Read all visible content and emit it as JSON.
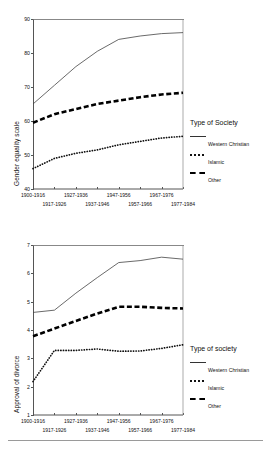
{
  "figure": {
    "divider_present": true
  },
  "charts": [
    {
      "ylabel": "Gender equality scale",
      "legend_title": "Type of Society",
      "legend": [
        {
          "label": "Western Christian",
          "style": "solid"
        },
        {
          "label": "Islamic",
          "style": "dotted"
        },
        {
          "label": "Other",
          "style": "dashed"
        }
      ],
      "yticks": [
        "40",
        "50",
        "60",
        "70",
        "80",
        "90"
      ],
      "xticks": [
        "1900-1916",
        "1917-1926",
        "1927-1936",
        "1937-1946",
        "1947-1956",
        "1957-1966",
        "1967-1976",
        "1977-1984"
      ]
    },
    {
      "ylabel": "Approval of divorce",
      "legend_title": "Type of society",
      "legend": [
        {
          "label": "Western Christian",
          "style": "solid"
        },
        {
          "label": "Islamic",
          "style": "dotted"
        },
        {
          "label": "Other",
          "style": "dashed"
        }
      ],
      "yticks": [
        "1",
        "2",
        "3",
        "4",
        "5",
        "6",
        "7"
      ],
      "xticks": [
        "1900-1916",
        "1917-1926",
        "1927-1936",
        "1937-1946",
        "1947-1956",
        "1957-1966",
        "1967-1976",
        "1977-1984"
      ]
    }
  ],
  "chart_data": [
    {
      "type": "line",
      "title": "",
      "xlabel": "",
      "ylabel": "Gender equality scale",
      "ylim": [
        40,
        90
      ],
      "grid": false,
      "legend_position": "right",
      "legend_title": "Type of Society",
      "categories": [
        "1900-1916",
        "1917-1926",
        "1927-1936",
        "1937-1946",
        "1947-1956",
        "1957-1966",
        "1967-1976",
        "1977-1984"
      ],
      "series": [
        {
          "name": "Western Christian",
          "style": "solid",
          "values": [
            65.0,
            70.5,
            76.0,
            80.5,
            84.0,
            85.0,
            85.7,
            86.0
          ]
        },
        {
          "name": "Islamic",
          "style": "dotted",
          "values": [
            46.0,
            49.0,
            50.5,
            51.5,
            53.0,
            54.0,
            55.0,
            55.5
          ]
        },
        {
          "name": "Other",
          "style": "dashed",
          "values": [
            59.5,
            62.0,
            63.5,
            65.0,
            66.0,
            67.0,
            67.8,
            68.3
          ]
        }
      ]
    },
    {
      "type": "line",
      "title": "",
      "xlabel": "",
      "ylabel": "Approval of divorce",
      "ylim": [
        1,
        7
      ],
      "grid": false,
      "legend_position": "right",
      "legend_title": "Type of society",
      "categories": [
        "1900-1916",
        "1917-1926",
        "1927-1936",
        "1937-1946",
        "1947-1956",
        "1957-1966",
        "1967-1976",
        "1977-1984"
      ],
      "series": [
        {
          "name": "Western Christian",
          "style": "solid",
          "values": [
            4.62,
            4.7,
            5.3,
            5.85,
            6.38,
            6.45,
            6.57,
            6.5
          ]
        },
        {
          "name": "Islamic",
          "style": "dotted",
          "values": [
            2.18,
            3.28,
            3.28,
            3.33,
            3.25,
            3.26,
            3.35,
            3.48
          ]
        },
        {
          "name": "Other",
          "style": "dashed",
          "values": [
            3.78,
            4.05,
            4.32,
            4.58,
            4.82,
            4.82,
            4.78,
            4.76
          ]
        }
      ]
    }
  ]
}
